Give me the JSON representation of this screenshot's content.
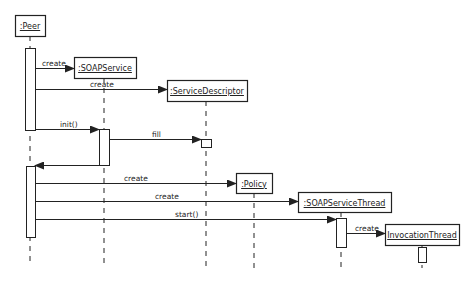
{
  "diagram": {
    "type": "uml-sequence",
    "colors": {
      "line": "#222222",
      "background": "#ffffff"
    },
    "objects": [
      {
        "id": "peer",
        "label": ":Peer",
        "box": [
          15,
          15,
          30,
          21
        ],
        "lifeline_x": 30,
        "lifeline_end": 265
      },
      {
        "id": "soapservice",
        "label": ":SOAPService",
        "box": [
          74,
          57,
          62,
          21
        ],
        "lifeline_x": 104,
        "lifeline_end": 268
      },
      {
        "id": "servicedescriptor",
        "label": ":ServiceDescriptor",
        "box": [
          167,
          80,
          80,
          21
        ],
        "lifeline_x": 206,
        "lifeline_end": 268
      },
      {
        "id": "policy",
        "label": ":Policy",
        "box": [
          236,
          173,
          36,
          20
        ],
        "lifeline_x": 254,
        "lifeline_end": 268
      },
      {
        "id": "soapservicethread",
        "label": ":SOAPServiceThread",
        "box": [
          298,
          192,
          93,
          20
        ],
        "lifeline_x": 341,
        "lifeline_end": 268
      },
      {
        "id": "invocationthread",
        "label": "InvocationThread",
        "box": [
          385,
          224,
          74,
          21
        ],
        "lifeline_x": 422,
        "lifeline_end": 268
      }
    ],
    "activations": [
      {
        "on": "peer",
        "rect": [
          25,
          48,
          10,
          82
        ]
      },
      {
        "on": "soapservice",
        "rect": [
          99,
          129,
          10,
          36
        ]
      },
      {
        "on": "servicedescriptor",
        "rect": [
          201,
          139,
          10,
          8
        ]
      },
      {
        "on": "peer",
        "rect": [
          26,
          166,
          9,
          71
        ]
      },
      {
        "on": "soapservicethread",
        "rect": [
          336,
          218,
          10,
          29
        ]
      },
      {
        "on": "invocationthread",
        "rect": [
          418,
          247,
          8,
          15
        ]
      }
    ],
    "messages": [
      {
        "label": "create",
        "from": "peer",
        "to": "soapservice",
        "x1": 35,
        "x2": 74,
        "y": 68,
        "label_x": 42
      },
      {
        "label": "create",
        "from": "peer",
        "to": "servicedescriptor",
        "x1": 35,
        "x2": 167,
        "y": 89,
        "label_x": 90
      },
      {
        "label": "init()",
        "from": "peer",
        "to": "soapservice",
        "x1": 35,
        "x2": 99,
        "y": 129,
        "label_x": 60
      },
      {
        "label": "fill",
        "from": "soapservice",
        "to": "servicedescriptor",
        "x1": 109,
        "x2": 201,
        "y": 139,
        "label_x": 152
      },
      {
        "label": "",
        "from": "soapservice",
        "to": "peer",
        "x1": 99,
        "x2": 35,
        "y": 165,
        "label_x": 0,
        "return": true
      },
      {
        "label": "create",
        "from": "peer",
        "to": "policy",
        "x1": 35,
        "x2": 236,
        "y": 183,
        "label_x": 124
      },
      {
        "label": "create",
        "from": "peer",
        "to": "soapservicethread",
        "x1": 35,
        "x2": 298,
        "y": 201,
        "label_x": 155
      },
      {
        "label": "start()",
        "from": "peer",
        "to": "soapservicethread",
        "x1": 35,
        "x2": 336,
        "y": 219,
        "label_x": 175
      },
      {
        "label": "create",
        "from": "soapservicethread",
        "to": "invocationthread",
        "x1": 346,
        "x2": 385,
        "y": 233,
        "label_x": 355
      }
    ]
  }
}
